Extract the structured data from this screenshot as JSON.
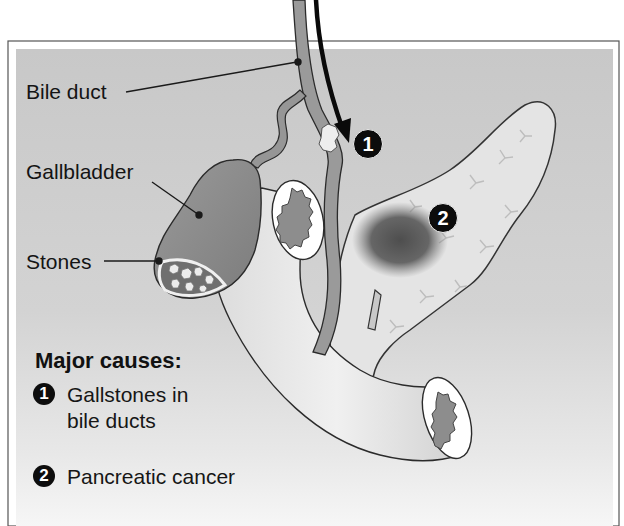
{
  "figure": {
    "labels": {
      "bile_duct": "Bile duct",
      "gallbladder": "Gallbladder",
      "stones": "Stones"
    },
    "markers": [
      {
        "id": 1,
        "text": "1"
      },
      {
        "id": 2,
        "text": "2"
      }
    ],
    "legend": {
      "title": "Major causes:",
      "items": [
        {
          "badge": "1",
          "line1": "Gallstones in",
          "line2": "bile ducts"
        },
        {
          "badge": "2",
          "line1": "Pancreatic cancer",
          "line2": ""
        }
      ]
    },
    "colors": {
      "background_top": "#c9c9c9",
      "background_bottom": "#f2f2f2",
      "organ_dark": "#8c8c8c",
      "organ_light": "#e6e6e6",
      "tumor": "#5a5a5a",
      "outline": "#2a2a2a"
    }
  }
}
